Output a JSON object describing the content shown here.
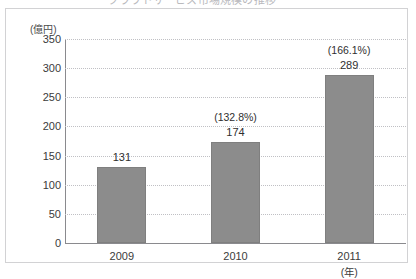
{
  "title_clipped": "クラウドサービス市場規模の推移",
  "chart_data": {
    "type": "bar",
    "title": "",
    "xlabel": "(年)",
    "ylabel": "(億円)",
    "categories": [
      "2009",
      "2010",
      "2011"
    ],
    "values": [
      131,
      174,
      289
    ],
    "value_labels": [
      "131",
      "174",
      "289"
    ],
    "annotations": [
      "",
      "(132.8%)",
      "(166.1%)"
    ],
    "ylim": [
      0,
      350
    ],
    "ytick_labels": [
      "0",
      "50",
      "100",
      "150",
      "200",
      "250",
      "300",
      "350"
    ],
    "ytick_values": [
      0,
      50,
      100,
      150,
      200,
      250,
      300,
      350
    ],
    "grid": true,
    "legend": "none",
    "bar_color": "#8c8c8c",
    "axis_color": "#8a8a8e",
    "grid_color": "#c0c0c4",
    "frame_color": "#d2d2d4",
    "text_color": "#3b3b3b"
  }
}
